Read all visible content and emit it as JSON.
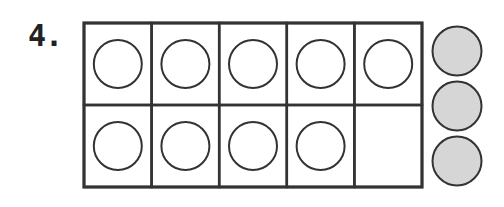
{
  "problem": {
    "number_label": "4.",
    "ten_frame": {
      "rows": 2,
      "cols": 5,
      "filled_cells": [
        true,
        true,
        true,
        true,
        true,
        true,
        true,
        true,
        true,
        false
      ]
    },
    "extra_counters": 3,
    "colors": {
      "line": "#333333",
      "counter_fill": "#d6d6d6",
      "background": "#ffffff"
    }
  }
}
